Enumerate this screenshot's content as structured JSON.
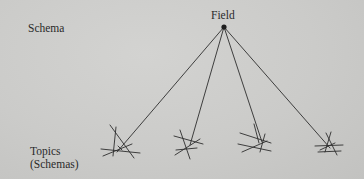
{
  "diagram": {
    "labels": {
      "schema": "Schema",
      "field": "Field",
      "topics_line1": "Topics",
      "topics_line2": "(Schemas)"
    },
    "root_node": {
      "name": "Field",
      "x": 224,
      "y": 27
    },
    "topic_clusters": [
      {
        "name": "topic-1",
        "x": 118,
        "y": 150
      },
      {
        "name": "topic-2",
        "x": 183,
        "y": 147
      },
      {
        "name": "topic-3",
        "x": 258,
        "y": 141
      },
      {
        "name": "topic-4",
        "x": 331,
        "y": 148
      }
    ],
    "colors": {
      "ink": "#2a2a2a",
      "background": "#cbcbc9"
    }
  }
}
